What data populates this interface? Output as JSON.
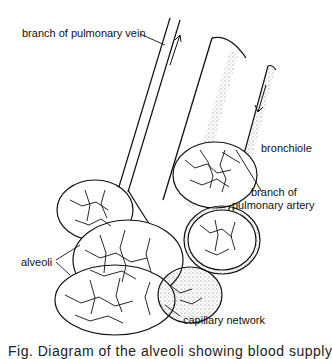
{
  "labels": {
    "pulmonary_vein": "branch of pulmonary vein",
    "bronchiole": "bronchiole",
    "pulmonary_artery_line1": "branch of",
    "pulmonary_artery_line2": "pulmonary artery",
    "alveoli": "alveoli",
    "capillary_network": "capillary network"
  },
  "caption": "Fig.     Diagram of the alveoli showing blood supply",
  "colors": {
    "ink": "#111111",
    "background": "#ffffff",
    "stipple": "#555555"
  }
}
